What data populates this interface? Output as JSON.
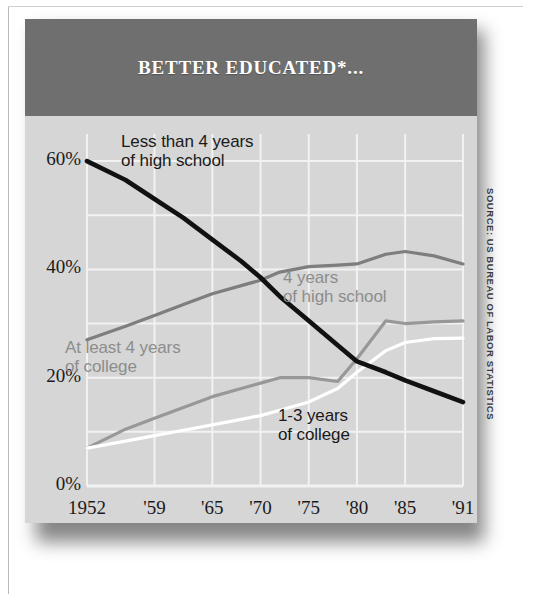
{
  "header": {
    "title": "BETTER EDUCATED*..."
  },
  "source": {
    "text": "SOURCE: US BUREAU OF LABOR STATISTICS"
  },
  "colors": {
    "header_band": "#6f6f6f",
    "plot_background": "#d6d6d6",
    "gridline": "#f2f2f2",
    "less_than_4_hs": "#111111",
    "four_years_hs": "#7e7e7e",
    "at_least_4_college": "#989898",
    "one_to_three_college": "#ffffff",
    "title_text": "#ffffff",
    "axis_text": "#1b1b1b"
  },
  "chart_data": {
    "type": "line",
    "title": "BETTER EDUCATED*...",
    "xlabel": "",
    "ylabel": "",
    "grid": true,
    "legend_position": "inline-annotations",
    "xlim": [
      1952,
      1991
    ],
    "ylim": [
      0,
      65
    ],
    "ytick_labels": [
      "0%",
      "20%",
      "40%",
      "60%"
    ],
    "ytick_values": [
      0,
      20,
      40,
      60
    ],
    "gridline_values": [
      0,
      10,
      20,
      30,
      40,
      50,
      60
    ],
    "xtick_labels": [
      "1952",
      "'59",
      "'65",
      "'70",
      "'75",
      "'80",
      "'85",
      "'91"
    ],
    "xtick_values": [
      1952,
      1959,
      1965,
      1970,
      1975,
      1980,
      1985,
      1991
    ],
    "series": [
      {
        "name": "Less than 4 years of high school",
        "color": "#111111",
        "label_lines": [
          "Less than 4 years",
          "of high school"
        ],
        "x": [
          1952,
          1956,
          1959,
          1962,
          1965,
          1968,
          1970,
          1972,
          1975,
          1978,
          1980,
          1983,
          1985,
          1988,
          1991
        ],
        "values": [
          60.0,
          56.5,
          53.0,
          49.5,
          45.5,
          41.5,
          38.5,
          35.0,
          30.5,
          26.0,
          23.0,
          21.0,
          19.5,
          17.5,
          15.5
        ]
      },
      {
        "name": "4 years of high school",
        "color": "#7e7e7e",
        "label_lines": [
          "4 years",
          "of high school"
        ],
        "x": [
          1952,
          1956,
          1959,
          1962,
          1965,
          1968,
          1970,
          1972,
          1975,
          1978,
          1980,
          1983,
          1985,
          1988,
          1991
        ],
        "values": [
          27.0,
          29.5,
          31.5,
          33.5,
          35.5,
          37.0,
          38.0,
          39.5,
          40.5,
          40.8,
          41.0,
          42.8,
          43.3,
          42.5,
          41.0
        ]
      },
      {
        "name": "At least 4 years of college",
        "color": "#989898",
        "label_lines": [
          "At least 4 years",
          "of college"
        ],
        "x": [
          1952,
          1956,
          1959,
          1962,
          1965,
          1968,
          1970,
          1972,
          1975,
          1978,
          1980,
          1983,
          1985,
          1988,
          1991
        ],
        "values": [
          7.0,
          10.5,
          12.5,
          14.5,
          16.5,
          18.0,
          19.0,
          20.0,
          20.0,
          19.3,
          23.5,
          30.5,
          30.0,
          30.3,
          30.5
        ]
      },
      {
        "name": "1-3 years of college",
        "color": "#ffffff",
        "label_lines": [
          "1-3 years",
          "of college"
        ],
        "x": [
          1952,
          1956,
          1959,
          1962,
          1965,
          1968,
          1970,
          1972,
          1975,
          1978,
          1980,
          1983,
          1985,
          1988,
          1991
        ],
        "values": [
          7.0,
          8.3,
          9.3,
          10.3,
          11.3,
          12.3,
          13.0,
          14.0,
          15.5,
          18.0,
          21.0,
          25.0,
          26.5,
          27.2,
          27.3
        ]
      }
    ],
    "annotations": [
      {
        "text": "Less than 4 years of high school",
        "series": 0
      },
      {
        "text": "4 years of high school",
        "series": 1
      },
      {
        "text": "At least 4 years of college",
        "series": 2
      },
      {
        "text": "1-3 years of college",
        "series": 3
      }
    ]
  }
}
